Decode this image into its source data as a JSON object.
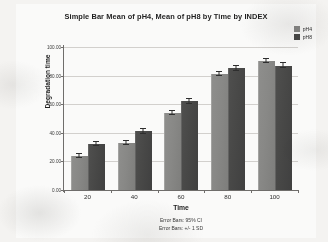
{
  "chart_data": {
    "type": "bar",
    "title": "Simple Bar Mean of pH4, Mean of pH8 by Time by INDEX",
    "xlabel": "Time",
    "ylabel": "Degradation time",
    "categories": [
      "20",
      "40",
      "60",
      "80",
      "100"
    ],
    "series": [
      {
        "name": "pH4",
        "color": "#888886",
        "values": [
          24,
          33,
          54,
          81,
          90
        ],
        "errors": [
          1.5,
          1.5,
          1.5,
          1.5,
          1.5
        ]
      },
      {
        "name": "pH8",
        "color": "#484847",
        "values": [
          32,
          41,
          62,
          85,
          87
        ],
        "errors": [
          1.5,
          1.5,
          1.5,
          1.5,
          1.5
        ]
      }
    ],
    "ylim": [
      0,
      100
    ],
    "yticks": [
      "0.00",
      "20.00",
      "40.00",
      "60.00",
      "80.00",
      "100.00"
    ],
    "ytick_values": [
      0,
      20,
      40,
      60,
      80,
      100
    ],
    "grid": true,
    "legend_position": "top-right",
    "annotations": [
      "Error Bars: 95% CI",
      "Error Bars: +/- 1 SD"
    ]
  },
  "legend": {
    "items": [
      {
        "label": "pH4",
        "color": "#888886"
      },
      {
        "label": "pH8",
        "color": "#484847"
      }
    ]
  },
  "footnotes": [
    "Error Bars: 95% CI",
    "Error Bars: +/- 1 SD"
  ]
}
